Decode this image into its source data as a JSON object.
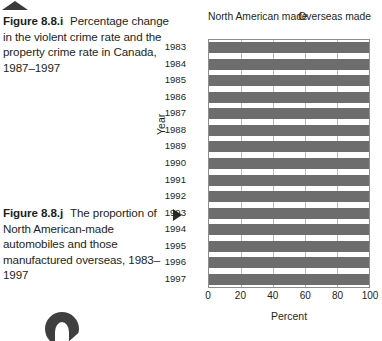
{
  "figures": {
    "i": {
      "label": "Figure 8.8.i",
      "text": "Percentage change in the violent crime rate and the property crime rate in Canada, 1987–1997"
    },
    "j": {
      "label": "Figure 8.8.j",
      "text": "The proportion of North American-made automobiles and those manufactured overseas, 1983–1997"
    }
  },
  "markers": {
    "top_arrow": "triangle-up-marker",
    "side_arrow": "triangle-right-marker",
    "bottom_glyph": "page-number-glyph"
  },
  "chart_data": {
    "type": "bar",
    "orientation": "horizontal",
    "stacked": true,
    "title": "",
    "xlabel": "Percent",
    "ylabel": "Year",
    "xlim": [
      0,
      100
    ],
    "xticks": [
      0,
      20,
      40,
      60,
      80,
      100
    ],
    "grid": true,
    "legend_position": "top",
    "header_left": "North American made",
    "header_right": "Overseas made",
    "categories": [
      "1983",
      "1984",
      "1985",
      "1986",
      "1987",
      "1988",
      "1989",
      "1990",
      "1991",
      "1992",
      "1993",
      "1994",
      "1995",
      "1996",
      "1997"
    ],
    "series": [
      {
        "name": "North American made",
        "color": "#6d6d6d",
        "values": [
          100,
          100,
          100,
          100,
          100,
          100,
          100,
          100,
          100,
          100,
          100,
          100,
          100,
          100,
          100
        ]
      },
      {
        "name": "Overseas made",
        "color": "#ffffff",
        "values": [
          0,
          0,
          0,
          0,
          0,
          0,
          0,
          0,
          0,
          0,
          0,
          0,
          0,
          0,
          0
        ]
      }
    ],
    "colors": {
      "bar": "#6d6d6d",
      "grid": "#b9b9b9",
      "axis": "#8d8d8d",
      "text": "#231f20"
    }
  }
}
